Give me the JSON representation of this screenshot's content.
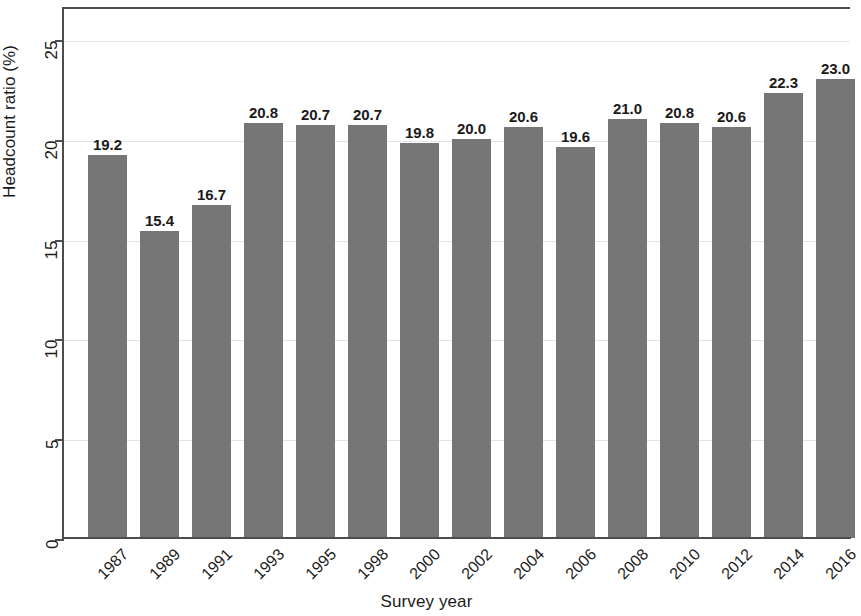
{
  "chart_data": {
    "type": "bar",
    "title": "",
    "xlabel": "Survey year",
    "ylabel": "Headcount ratio (%)",
    "categories": [
      "1987",
      "1989",
      "1991",
      "1993",
      "1995",
      "1998",
      "2000",
      "2002",
      "2004",
      "2006",
      "2008",
      "2010",
      "2012",
      "2014",
      "2016"
    ],
    "values": [
      19.2,
      15.4,
      16.7,
      20.8,
      20.7,
      20.7,
      19.8,
      20.0,
      20.6,
      19.6,
      21.0,
      20.8,
      20.6,
      22.3,
      23.0
    ],
    "value_labels": [
      "19.2",
      "15.4",
      "16.7",
      "20.8",
      "20.7",
      "20.7",
      "19.8",
      "20.0",
      "20.6",
      "19.6",
      "21.0",
      "20.8",
      "20.6",
      "22.3",
      "23.0"
    ],
    "ylim": [
      0,
      26.6
    ],
    "yticks": [
      0,
      5,
      10,
      15,
      20,
      25
    ],
    "ytick_labels": [
      "0",
      "5",
      "10",
      "15",
      "20",
      "25"
    ],
    "grid": true,
    "grid_axis": "y",
    "legend": null,
    "bar_color": "#757575",
    "axis_color": "#4d4d4d",
    "grid_color": "#e4e4e4",
    "text_color": "#1a1a1a",
    "background": "#ffffff"
  }
}
